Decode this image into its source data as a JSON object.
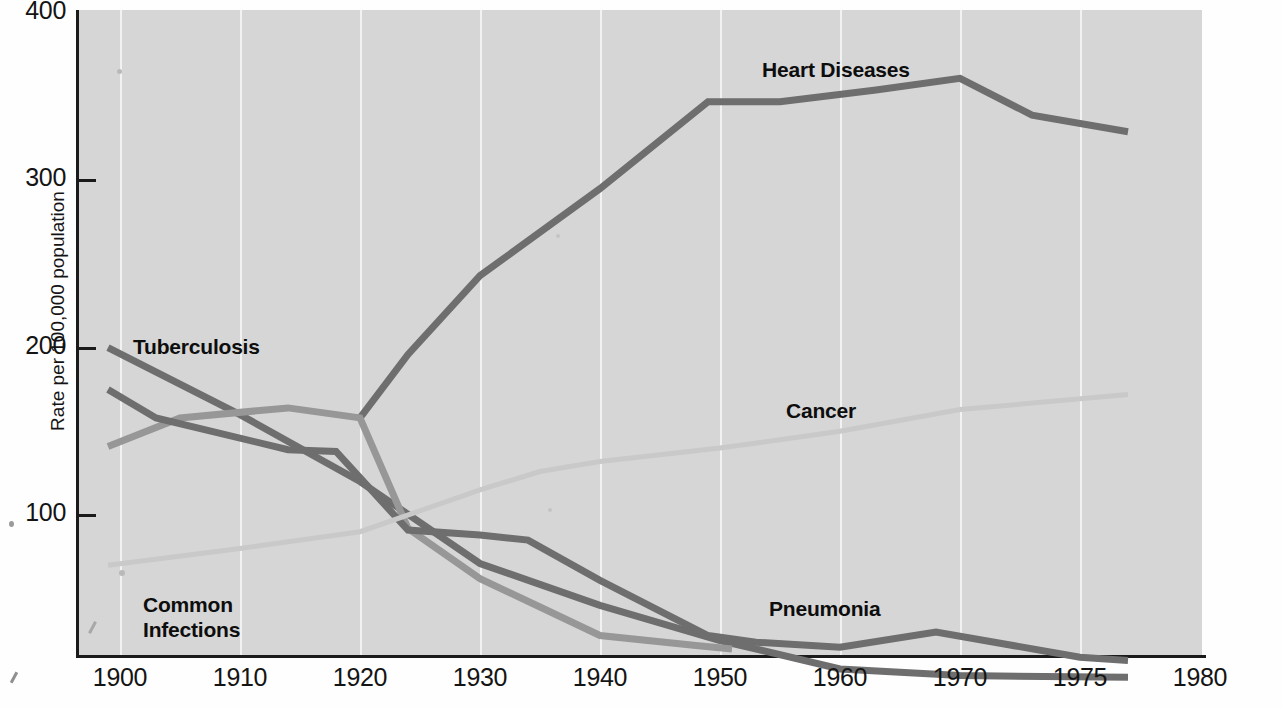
{
  "chart_data": {
    "type": "line",
    "title": "",
    "xlabel": "",
    "ylabel": "Rate per 100,000 population",
    "xlim": [
      1898,
      1980
    ],
    "ylim": [
      0,
      400
    ],
    "grid": "vertical-white-gridlines",
    "legend": "inline-labels",
    "x_ticks": [
      "1900",
      "1910",
      "1920",
      "1930",
      "1940",
      "1950",
      "1960",
      "1970",
      "1975",
      "1980"
    ],
    "y_ticks": [
      "100",
      "200",
      "300",
      "400"
    ],
    "series": [
      {
        "name": "Heart Diseases",
        "color": "#6e6e6e",
        "label_x": 762,
        "label_y": 58,
        "points": [
          [
            1920,
            158
          ],
          [
            1924,
            196
          ],
          [
            1930,
            243
          ],
          [
            1940,
            295
          ],
          [
            1949,
            347
          ],
          [
            1955,
            347
          ],
          [
            1963,
            354
          ],
          [
            1970,
            361
          ],
          [
            1973,
            339
          ],
          [
            1977,
            329
          ]
        ]
      },
      {
        "name": "Tuberculosis",
        "color": "#6e6e6e",
        "label_x": 133,
        "label_y": 335,
        "points": [
          [
            1899,
            200
          ],
          [
            1910,
            160
          ],
          [
            1920,
            120
          ],
          [
            1930,
            71
          ],
          [
            1940,
            46
          ],
          [
            1950,
            25
          ],
          [
            1960,
            8
          ],
          [
            1970,
            4
          ],
          [
            1977,
            3
          ]
        ]
      },
      {
        "name": "Common Infections",
        "color": "#979797",
        "label_x": 143,
        "label_y": 593,
        "points": [
          [
            1899,
            141
          ],
          [
            1905,
            158
          ],
          [
            1914,
            164
          ],
          [
            1920,
            158
          ],
          [
            1924,
            92
          ],
          [
            1930,
            62
          ],
          [
            1935,
            45
          ],
          [
            1940,
            28
          ],
          [
            1948,
            22
          ],
          [
            1951,
            20
          ]
        ]
      },
      {
        "name": "Pneumonia",
        "color": "#6e6e6e",
        "label_x": 769,
        "label_y": 597,
        "points": [
          [
            1899,
            175
          ],
          [
            1903,
            158
          ],
          [
            1914,
            139
          ],
          [
            1918,
            138
          ],
          [
            1924,
            91
          ],
          [
            1930,
            88
          ],
          [
            1934,
            85
          ],
          [
            1940,
            61
          ],
          [
            1949,
            28
          ],
          [
            1953,
            24
          ],
          [
            1960,
            21
          ],
          [
            1968,
            30
          ],
          [
            1975,
            15
          ],
          [
            1977,
            13
          ]
        ]
      },
      {
        "name": "Cancer",
        "color": "#c9c9c9",
        "label_x": 786,
        "label_y": 399,
        "points": [
          [
            1899,
            70
          ],
          [
            1910,
            80
          ],
          [
            1920,
            90
          ],
          [
            1930,
            115
          ],
          [
            1935,
            126
          ],
          [
            1940,
            132
          ],
          [
            1950,
            140
          ],
          [
            1960,
            150
          ],
          [
            1970,
            163
          ],
          [
            1977,
            172
          ]
        ]
      }
    ]
  },
  "axis": {
    "y_title": "Rate per 100,000 population"
  },
  "labels": {
    "heart": "Heart Diseases",
    "tuberculosis": "Tuberculosis",
    "common_infections": "Common\nInfections",
    "pneumonia": "Pneumonia",
    "cancer": "Cancer"
  },
  "colors": {
    "panel_background": "#d6d6d6",
    "gridline": "#f2f2f2",
    "axis": "#1b1b1b",
    "dark_series": "#6e6e6e",
    "mid_series": "#979797",
    "light_series": "#c9c9c9"
  }
}
